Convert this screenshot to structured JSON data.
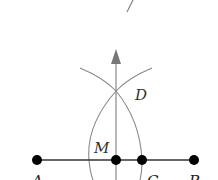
{
  "diagram": {
    "type": "geometric-construction",
    "colors": {
      "line": "#333333",
      "construction": "#888888",
      "arrow": "#777777",
      "point": "#000000",
      "label": "#333333"
    },
    "points": [
      {
        "id": "A",
        "label": "A",
        "x": 37,
        "y": 160
      },
      {
        "id": "M",
        "label": "M",
        "x": 116,
        "y": 160
      },
      {
        "id": "C",
        "label": "C",
        "x": 142,
        "y": 160
      },
      {
        "id": "B",
        "label": "B",
        "x": 194,
        "y": 160
      },
      {
        "id": "D",
        "label": "D",
        "x": 116,
        "y": 91
      }
    ],
    "labels": {
      "A": "A",
      "B": "B",
      "C": "C",
      "D": "D",
      "M": "M"
    },
    "segments": [
      {
        "from": "A",
        "to": "B"
      }
    ],
    "ray": {
      "from_y": 180,
      "to_y": 49,
      "x": 116,
      "arrowhead": true
    },
    "tick_mark": {
      "x1": 133,
      "y1": 0,
      "x2": 127,
      "y2": 12
    }
  }
}
